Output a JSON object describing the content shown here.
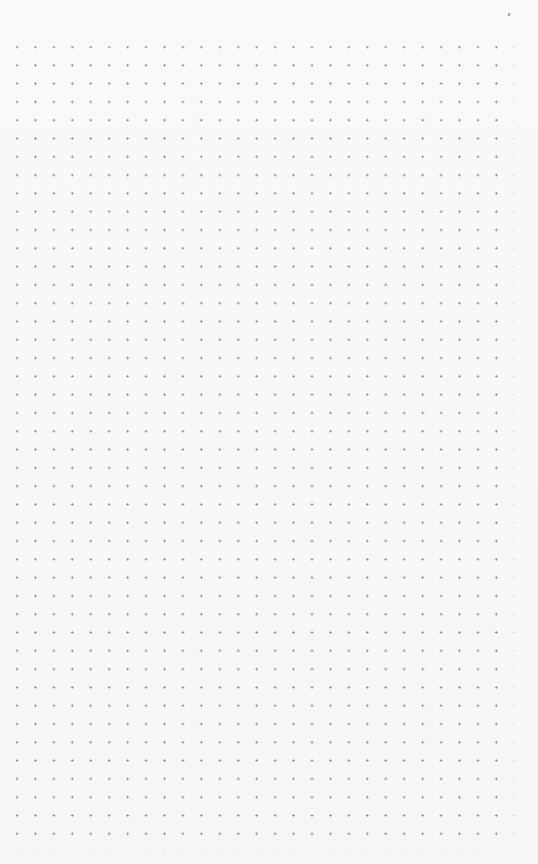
{
  "page": {
    "type": "dot-grid-paper",
    "background_color": "#f7f7f6",
    "dot_color": "#8e8e8e",
    "grid": {
      "columns": 27,
      "rows": 44,
      "origin_x": 17,
      "origin_y": 47,
      "spacing_x": 18.45,
      "spacing_y": 18.3
    }
  }
}
